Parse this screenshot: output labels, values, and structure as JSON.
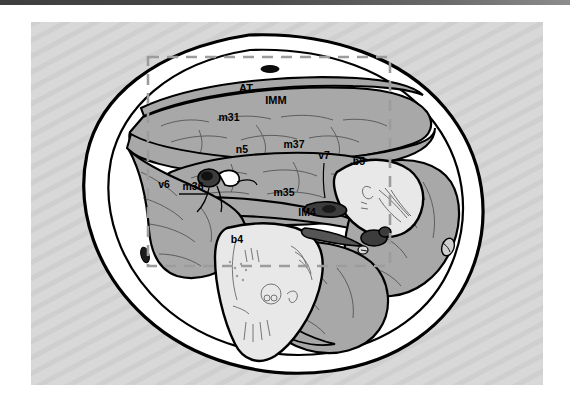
{
  "figure": {
    "type": "anatomical-cross-section",
    "colors": {
      "background_panel": "#d6d6d6",
      "stripe": "#cdcdcd",
      "skin_outline": "#000000",
      "subcutaneous_fill": "#ffffff",
      "muscle_fill": "#a8a8a8",
      "bone_fill": "#e2e2e2",
      "vessel_dark": "#3a3a3a",
      "roi_dash": "#9a9a9a",
      "top_bar": "#4a4a4a",
      "label_text": "#000000"
    },
    "roi_box": {
      "name": "region-of-interest",
      "x": 148,
      "y": 57,
      "width": 242,
      "height": 209,
      "style": "dashed"
    },
    "labels": [
      {
        "id": "AT",
        "text": "AT",
        "x": 246,
        "y": 92,
        "anchor": "middle",
        "size": 11,
        "leader": null
      },
      {
        "id": "IMM",
        "text": "IMM",
        "x": 276,
        "y": 104,
        "anchor": "middle",
        "size": 11,
        "leader": null
      },
      {
        "id": "m31",
        "text": "m31",
        "x": 229,
        "y": 121,
        "anchor": "middle",
        "size": 10,
        "leader": null
      },
      {
        "id": "n5",
        "text": "n5",
        "x": 242,
        "y": 153,
        "anchor": "middle",
        "size": 10,
        "leader": null
      },
      {
        "id": "m37",
        "text": "m37",
        "x": 294,
        "y": 148,
        "anchor": "middle",
        "size": 10,
        "leader": null
      },
      {
        "id": "v7",
        "text": "v7",
        "x": 324,
        "y": 159,
        "anchor": "middle",
        "size": 10,
        "leader": "324,164 318,178"
      },
      {
        "id": "b5",
        "text": "b5",
        "x": 359,
        "y": 165,
        "anchor": "middle",
        "size": 10,
        "leader": null
      },
      {
        "id": "v6",
        "text": "v6",
        "x": 164,
        "y": 188,
        "anchor": "middle",
        "size": 10,
        "leader": null
      },
      {
        "id": "m36",
        "text": "m36",
        "x": 193,
        "y": 190,
        "anchor": "middle",
        "size": 10,
        "leader": "179,194 208,194"
      },
      {
        "id": "m35",
        "text": "m35",
        "x": 284,
        "y": 196,
        "anchor": "middle",
        "size": 10,
        "leader": null
      },
      {
        "id": "lM4",
        "text": "lM4",
        "x": 307,
        "y": 216,
        "anchor": "middle",
        "size": 10,
        "leader": null
      },
      {
        "id": "b4",
        "text": "b4",
        "x": 237,
        "y": 243,
        "anchor": "middle",
        "size": 10,
        "leader": null
      }
    ],
    "structures": [
      {
        "id": "skin-outer-contour",
        "kind": "outline",
        "fill": "#ffffff"
      },
      {
        "id": "subcutaneous-layer",
        "kind": "outline",
        "fill": "#ffffff"
      },
      {
        "id": "muscle-m31",
        "kind": "muscle",
        "fill": "#a8a8a8"
      },
      {
        "id": "muscle-m37",
        "kind": "muscle",
        "fill": "#a8a8a8"
      },
      {
        "id": "muscle-m35",
        "kind": "muscle",
        "fill": "#a8a8a8"
      },
      {
        "id": "muscle-m36",
        "kind": "muscle",
        "fill": "#a8a8a8"
      },
      {
        "id": "bone-b4",
        "kind": "bone",
        "fill": "#e6e6e6"
      },
      {
        "id": "bone-b5",
        "kind": "bone",
        "fill": "#e6e6e6"
      },
      {
        "id": "vessel-v6",
        "kind": "vessel",
        "fill": "#3a3a3a"
      },
      {
        "id": "vessel-v7",
        "kind": "vessel",
        "fill": "#3a3a3a"
      },
      {
        "id": "vessel-dorsal-oval",
        "kind": "vessel",
        "fill": "#101010"
      },
      {
        "id": "vessel-ventral-oval",
        "kind": "vessel",
        "fill": "#202020"
      },
      {
        "id": "nerve-n5",
        "kind": "nerve",
        "fill": "#ffffff"
      }
    ]
  }
}
